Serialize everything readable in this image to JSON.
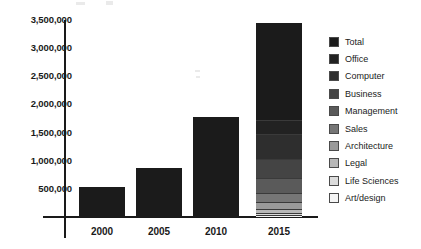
{
  "chart_data": {
    "type": "bar",
    "title": "",
    "subtitle": "",
    "xlabel": "",
    "ylabel": "",
    "categories": [
      "2000",
      "2005",
      "2010",
      "2015"
    ],
    "ylim": [
      0,
      3500000
    ],
    "ytick_labels": [
      "3,500,000",
      "3,000,000",
      "2,500,000",
      "2,000,000",
      "1,500,000",
      "1,000,000",
      "500,000"
    ],
    "ytick_values": [
      3500000,
      3000000,
      2500000,
      2000000,
      1500000,
      1000000,
      500000
    ],
    "grid": false,
    "legend_position": "right",
    "stacked": true,
    "totals": [
      540000,
      870000,
      1780000,
      3440000
    ],
    "series": [
      {
        "name": "Total",
        "color": "#1b1b1b",
        "values": [
          540000,
          870000,
          1780000,
          1710000
        ]
      },
      {
        "name": "Office",
        "color": "#222222",
        "values": [
          0,
          0,
          0,
          260000
        ]
      },
      {
        "name": "Computer",
        "color": "#2e2e2e",
        "values": [
          0,
          0,
          0,
          430000
        ]
      },
      {
        "name": "Business",
        "color": "#444444",
        "values": [
          0,
          0,
          0,
          350000
        ]
      },
      {
        "name": "Management",
        "color": "#5a5a5a",
        "values": [
          0,
          0,
          0,
          260000
        ]
      },
      {
        "name": "Sales",
        "color": "#767676",
        "values": [
          0,
          0,
          0,
          160000
        ]
      },
      {
        "name": "Architecture",
        "color": "#9a9a9a",
        "values": [
          0,
          0,
          0,
          130000
        ]
      },
      {
        "name": "Legal",
        "color": "#b8b8b8",
        "values": [
          0,
          0,
          0,
          60000
        ]
      },
      {
        "name": "Life Sciences",
        "color": "#dcdcdc",
        "values": [
          0,
          0,
          0,
          40000
        ]
      },
      {
        "name": "Art/design",
        "color": "#f5f5f5",
        "values": [
          0,
          0,
          0,
          40000
        ]
      }
    ]
  },
  "legend": {
    "items": [
      {
        "label": "Total",
        "color": "#1b1b1b"
      },
      {
        "label": "Office",
        "color": "#222222"
      },
      {
        "label": "Computer",
        "color": "#2e2e2e"
      },
      {
        "label": "Business",
        "color": "#444444"
      },
      {
        "label": "Management",
        "color": "#5a5a5a"
      },
      {
        "label": "Sales",
        "color": "#767676"
      },
      {
        "label": "Architecture",
        "color": "#9a9a9a"
      },
      {
        "label": "Legal",
        "color": "#b8b8b8"
      },
      {
        "label": "Life Sciences",
        "color": "#dcdcdc"
      },
      {
        "label": "Art/design",
        "color": "#f5f5f5"
      }
    ]
  },
  "colors": {
    "axis": "#1a1a1a",
    "text": "#1a1a1a",
    "background": "#ffffff"
  }
}
